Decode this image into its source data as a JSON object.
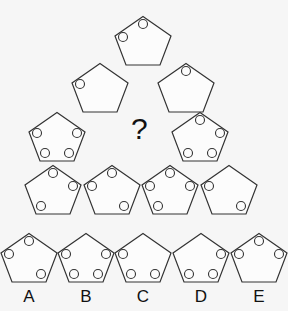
{
  "puzzle": {
    "question_mark": "?",
    "slot_positions": {
      "T": [
        29,
        8
      ],
      "UL": [
        9,
        21
      ],
      "UR": [
        49,
        21
      ],
      "LL": [
        17,
        41
      ],
      "LR": [
        41,
        41
      ]
    },
    "pyramid": [
      {
        "row": 1,
        "cx": 143,
        "top": 16,
        "circles": [
          "T",
          "UL"
        ]
      },
      {
        "row": 2,
        "cx": 100,
        "top": 63,
        "circles": [
          "UL"
        ]
      },
      {
        "row": 2,
        "cx": 186,
        "top": 63,
        "circles": [
          "T"
        ]
      },
      {
        "row": 3,
        "cx": 57,
        "top": 112,
        "circles": [
          "UL",
          "UR",
          "LL",
          "LR"
        ]
      },
      {
        "row": 3,
        "cx": 200,
        "top": 112,
        "circles": [
          "T",
          "UR",
          "LL",
          "LR"
        ]
      },
      {
        "row": 4,
        "cx": 53,
        "top": 165,
        "circles": [
          "T",
          "UR",
          "LL"
        ]
      },
      {
        "row": 4,
        "cx": 112,
        "top": 165,
        "circles": [
          "T",
          "UL",
          "LR"
        ]
      },
      {
        "row": 4,
        "cx": 170,
        "top": 165,
        "circles": [
          "T",
          "UL",
          "UR",
          "LL"
        ]
      },
      {
        "row": 4,
        "cx": 229,
        "top": 165,
        "circles": [
          "UL",
          "LR"
        ]
      }
    ],
    "options": [
      {
        "label": "A",
        "cx": 29,
        "top": 233,
        "circles": [
          "T",
          "UL",
          "LR"
        ]
      },
      {
        "label": "B",
        "cx": 86,
        "top": 233,
        "circles": [
          "UL",
          "UR",
          "LL",
          "LR"
        ]
      },
      {
        "label": "C",
        "cx": 143,
        "top": 233,
        "circles": [
          "UL",
          "LL",
          "LR"
        ]
      },
      {
        "label": "D",
        "cx": 201,
        "top": 233,
        "circles": [
          "UR",
          "LL",
          "LR"
        ]
      },
      {
        "label": "E",
        "cx": 259,
        "top": 233,
        "circles": [
          "T",
          "UL",
          "UR"
        ]
      }
    ]
  }
}
